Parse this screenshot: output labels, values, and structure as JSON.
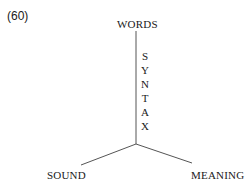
{
  "example_number": "(60)",
  "nodes": {
    "top": "WORDS",
    "bottom_left": "SOUND",
    "bottom_right": "MEANING"
  },
  "edge_label": {
    "text": "SYNTAX",
    "letters": [
      "S",
      "Y",
      "N",
      "T",
      "A",
      "X"
    ]
  },
  "colors": {
    "line": "#555555",
    "text": "#1a1a1a"
  }
}
